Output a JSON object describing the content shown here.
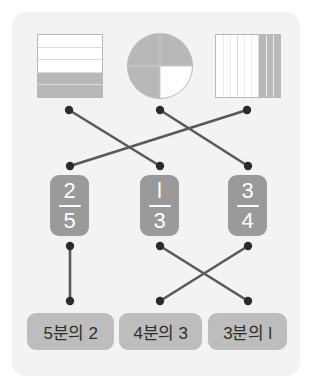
{
  "panel": {
    "background": "#f2f3f2",
    "page_background": "#ffffff"
  },
  "colors": {
    "shape_fill": "#b8b8b8",
    "shape_outline": "#b9b9b9",
    "card_background": "#9a9a9a",
    "card_text": "#ffffff",
    "pill_background": "#bdbdbd",
    "pill_text": "#2f2f2f",
    "line": "#595959",
    "dot": "#2b2b2b"
  },
  "shapes": [
    {
      "name": "horizontal-band-rectangle",
      "kind": "rectangle-horizontal",
      "total_parts": 5,
      "shaded_parts": 2,
      "shaded_position": "bottom",
      "fraction": "2/5"
    },
    {
      "name": "quartered-circle",
      "kind": "circle-quarters",
      "total_parts": 4,
      "shaded_parts": 3,
      "shaded_position": "top-right, bottom-left, bottom-right",
      "fraction": "3/4"
    },
    {
      "name": "vertical-stripe-rectangle",
      "kind": "rectangle-vertical",
      "total_parts": 3,
      "shaded_parts": 1,
      "shaded_position": "right",
      "fraction": "1/3"
    }
  ],
  "fraction_cards": [
    {
      "numerator": "2",
      "denominator": "5",
      "label": "2/5"
    },
    {
      "numerator": "l",
      "denominator": "3",
      "label": "1/3"
    },
    {
      "numerator": "3",
      "denominator": "4",
      "label": "3/4"
    }
  ],
  "word_pills": [
    {
      "text": "5분의 2",
      "fraction": "2/5"
    },
    {
      "text": "4분의 3",
      "fraction": "3/4"
    },
    {
      "text": "3분의 l",
      "fraction": "1/3"
    }
  ],
  "connections_top": [
    {
      "from": "shape-1-horizontal-band-rectangle",
      "to": "card-2-one-third",
      "type": "crossing"
    },
    {
      "from": "shape-2-quartered-circle",
      "to": "card-3-three-quarters",
      "type": "crossing"
    },
    {
      "from": "shape-3-vertical-stripe-rectangle",
      "to": "card-1-two-fifths",
      "type": "crossing"
    }
  ],
  "connections_bottom": [
    {
      "from": "card-1-two-fifths",
      "to": "pill-1-5bunui2",
      "type": "straight"
    },
    {
      "from": "card-2-one-third",
      "to": "pill-3-3bunui1",
      "type": "crossing"
    },
    {
      "from": "card-3-three-quarters",
      "to": "pill-2-4bunui3",
      "type": "crossing"
    }
  ]
}
